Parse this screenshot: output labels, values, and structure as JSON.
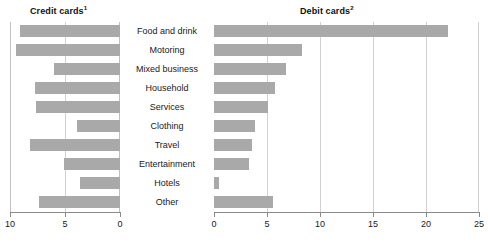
{
  "chart_data": [
    {
      "type": "bar",
      "orientation": "horizontal",
      "title": "Credit cards",
      "title_superscript": "1",
      "panel": "left",
      "direction": "right-to-left",
      "categories": [
        "Food and drink",
        "Motoring",
        "Mixed business",
        "Household",
        "Services",
        "Clothing",
        "Travel",
        "Entertainment",
        "Hotels",
        "Other"
      ],
      "values": [
        9.1,
        9.5,
        6.0,
        7.7,
        7.6,
        3.9,
        8.2,
        5.1,
        3.6,
        7.4
      ],
      "xlabel": "",
      "ylabel": "",
      "xlim": [
        10,
        0
      ],
      "ticks": [
        10,
        5,
        0
      ],
      "tick_labels": [
        "10",
        "5",
        "0"
      ],
      "grid": true,
      "legend": "none",
      "bar_color": "#a9a9a9"
    },
    {
      "type": "bar",
      "orientation": "horizontal",
      "title": "Debit cards",
      "title_superscript": "2",
      "panel": "right",
      "direction": "left-to-right",
      "categories": [
        "Food and drink",
        "Motoring",
        "Mixed business",
        "Household",
        "Services",
        "Clothing",
        "Travel",
        "Entertainment",
        "Hotels",
        "Other"
      ],
      "values": [
        22.1,
        8.3,
        6.8,
        5.8,
        5.1,
        3.9,
        3.6,
        3.3,
        0.5,
        5.6
      ],
      "xlabel": "",
      "ylabel": "",
      "xlim": [
        0,
        25
      ],
      "ticks": [
        0,
        5,
        10,
        15,
        20,
        25
      ],
      "tick_labels": [
        "0",
        "5",
        "10",
        "15",
        "20",
        "25"
      ],
      "grid": true,
      "legend": "none",
      "bar_color": "#a9a9a9"
    }
  ]
}
